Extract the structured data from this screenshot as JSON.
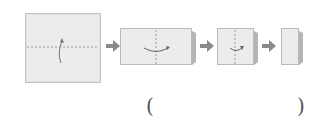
{
  "diagram": {
    "type": "paper-folding-sequence",
    "steps": [
      {
        "shape": "square",
        "fold_line": "horizontal-dashed",
        "fold_direction": "up"
      },
      {
        "shape": "rectangle",
        "fold_line": "vertical-dashed",
        "fold_direction": "right"
      },
      {
        "shape": "small-square",
        "fold_line": "vertical-dashed",
        "fold_direction": "right"
      },
      {
        "shape": "narrow-rectangle",
        "fold_line": "none",
        "fold_direction": "none"
      }
    ],
    "answer_blank": {
      "open": "(",
      "close": ")"
    },
    "colors": {
      "paper": "#ececec",
      "border": "#b9b9b9",
      "arrow": "#8a8a8a",
      "dash": "#9a9a9a"
    }
  }
}
